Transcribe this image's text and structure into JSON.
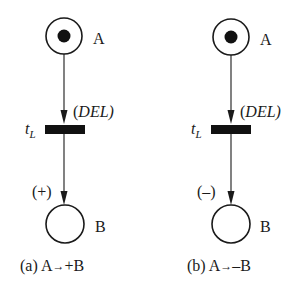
{
  "colors": {
    "stroke": "#1a1a1a",
    "fill": "#111111",
    "background": "#ffffff"
  },
  "panels": [
    {
      "id": "a",
      "place_top": {
        "label": "A",
        "has_token": true
      },
      "arc_top_label": "(DEL)",
      "transition": {
        "label_main": "t",
        "label_sub": "L"
      },
      "arc_bottom_label": "(+)",
      "place_bottom": {
        "label": "B",
        "has_token": false
      },
      "caption": {
        "prefix": "(a) A",
        "arrow": "→",
        "suffix": "+B"
      }
    },
    {
      "id": "b",
      "place_top": {
        "label": "A",
        "has_token": true
      },
      "arc_top_label": "(DEL)",
      "transition": {
        "label_main": "t",
        "label_sub": "L"
      },
      "arc_bottom_label": "(–)",
      "place_bottom": {
        "label": "B",
        "has_token": false
      },
      "caption": {
        "prefix": "(b) A",
        "arrow": "→",
        "suffix": "–B"
      }
    }
  ]
}
